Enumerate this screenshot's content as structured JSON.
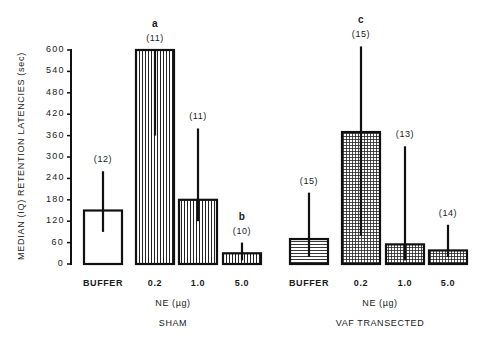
{
  "chart_data": {
    "type": "bar",
    "title": "",
    "ylabel": "MEDIAN (IQ) RETENTION LATENCIES (sec)",
    "ylim": [
      0,
      600
    ],
    "yticks": [
      0,
      60,
      120,
      180,
      240,
      300,
      360,
      420,
      480,
      540,
      600
    ],
    "grid": false,
    "panels": [
      {
        "group_label": "SHAM",
        "xlabel": "NE (µg)",
        "categories": [
          "BUFFER",
          "0.2",
          "1.0",
          "5.0"
        ],
        "values": [
          150,
          600,
          180,
          30
        ],
        "iq_low": [
          90,
          360,
          120,
          10
        ],
        "iq_high": [
          260,
          600,
          380,
          60
        ],
        "n": [
          "(12)",
          "(11)",
          "(11)",
          "(10)"
        ],
        "annotations": [
          "",
          "a",
          "",
          "b"
        ],
        "patterns": [
          "none",
          "vertical",
          "vertical",
          "vertical"
        ]
      },
      {
        "group_label": "VAF TRANSECTED",
        "xlabel": "NE (µg)",
        "categories": [
          "BUFFER",
          "0.2",
          "1.0",
          "5.0"
        ],
        "values": [
          70,
          370,
          55,
          38
        ],
        "iq_low": [
          20,
          80,
          10,
          20
        ],
        "iq_high": [
          200,
          610,
          330,
          110
        ],
        "n": [
          "(15)",
          "(15)",
          "(13)",
          "(14)"
        ],
        "annotations": [
          "",
          "c",
          "",
          ""
        ],
        "patterns": [
          "horizontal",
          "grid",
          "grid",
          "grid"
        ]
      }
    ]
  },
  "labels": {
    "ylabel": "MEDIAN (IQ) RETENTION LATENCIES (sec)",
    "sham_xlabel": "NE (µg)",
    "sham_group": "SHAM",
    "vaf_xlabel": "NE (µg)",
    "vaf_group": "VAF TRANSECTED"
  }
}
